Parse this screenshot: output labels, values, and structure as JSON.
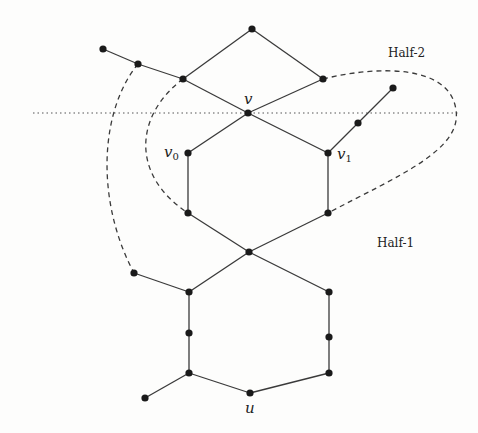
{
  "diagram": {
    "labels": {
      "v": "v",
      "v0": "v",
      "v0_sub": "0",
      "v1": "v",
      "v1_sub": "1",
      "u": "u",
      "half1": "Half-1",
      "half2": "Half-2"
    },
    "colors": {
      "edge": "#3a3a3a",
      "vertex": "#1a1a1a",
      "background": "#fdfdfc"
    },
    "vertices": {
      "top": [
        252,
        29
      ],
      "far_left": [
        103,
        49
      ],
      "left_mid": [
        138,
        64
      ],
      "left_upper": [
        183,
        79
      ],
      "right_upper": [
        323,
        79
      ],
      "v": [
        248,
        113
      ],
      "far_right": [
        393,
        88
      ],
      "right_mid": [
        358,
        123
      ],
      "v0": [
        188,
        153
      ],
      "v1": [
        328,
        153
      ],
      "v0_low": [
        188,
        213
      ],
      "v1_low": [
        328,
        213
      ],
      "center": [
        249,
        252
      ],
      "left_tail": [
        134,
        273
      ],
      "hex_left_top": [
        189,
        292
      ],
      "hex_right_top": [
        329,
        292
      ],
      "hex_left_mid": [
        189,
        333
      ],
      "hex_right_mid": [
        329,
        337
      ],
      "hex_left_bot": [
        189,
        373
      ],
      "hex_right_bot": [
        329,
        373
      ],
      "u": [
        250,
        393
      ],
      "bottom_tail": [
        145,
        398
      ]
    },
    "separator": {
      "style": "dotted",
      "y": 113,
      "x1": 33,
      "x2": 460
    }
  }
}
